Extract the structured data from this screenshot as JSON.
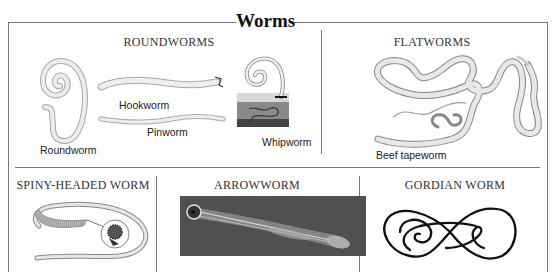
{
  "figure": {
    "title": "Worms",
    "sections": {
      "roundworms": {
        "heading": "ROUNDWORMS",
        "labels": {
          "roundworm": "Roundworm",
          "hookworm": "Hookworm",
          "pinworm": "Pinworm",
          "whipworm": "Whipworm"
        }
      },
      "flatworms": {
        "heading": "FLATWORMS",
        "labels": {
          "beef_tapeworm": "Beef tapeworm"
        }
      },
      "spiny_headed": {
        "heading": "SPINY-HEADED WORM"
      },
      "arrowworm": {
        "heading": "ARROWWORM"
      },
      "gordian": {
        "heading": "GORDIAN WORM"
      }
    },
    "colors": {
      "border": "#777777",
      "worm_light": "#e4e4e4",
      "worm_outline": "#9a9a9a",
      "tapeworm_band": "#b8b8b8",
      "arrowworm_bg": "#4a4a4a",
      "gordian_stroke": "#111111"
    }
  }
}
